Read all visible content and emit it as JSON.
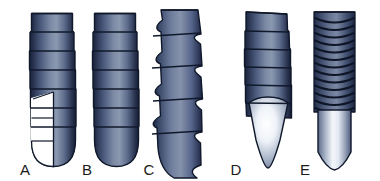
{
  "figure": {
    "background_color": "#ffffff",
    "items": [
      {
        "label": "A",
        "name": "implant-a",
        "description": "Cylindrical implant with V-shaped square threads and rounded apex, shown in partial cut-away section",
        "thread_type": "square",
        "body_shape": "cylindrical",
        "apex": "rounded",
        "thread_count": 7,
        "has_cutaway": true,
        "label_x": 25,
        "label_y": 174
      },
      {
        "label": "B",
        "name": "implant-b",
        "description": "Cylindrical implant with square threads and rounded apex",
        "thread_type": "square",
        "body_shape": "cylindrical",
        "apex": "rounded",
        "thread_count": 7,
        "has_cutaway": false,
        "label_x": 87,
        "label_y": 174
      },
      {
        "label": "C",
        "name": "implant-c",
        "description": "Implant with deep buttress reverse-cut threads forming scalloped profile",
        "thread_type": "buttress",
        "body_shape": "cylindrical",
        "apex": "tapered",
        "thread_count": 5,
        "has_cutaway": false,
        "label_x": 149,
        "label_y": 174
      },
      {
        "label": "D",
        "name": "implant-d",
        "description": "Cylindrical implant with square threads and sharp conical apex",
        "thread_type": "square",
        "body_shape": "cylindrical",
        "apex": "conical-pointed",
        "thread_count": 6,
        "has_cutaway": false,
        "label_x": 236,
        "label_y": 174
      },
      {
        "label": "E",
        "name": "implant-e",
        "description": "Cylindrical implant with fine micro-threads and pointed apex",
        "thread_type": "micro-thread",
        "body_shape": "cylindrical",
        "apex": "pointed",
        "thread_count": 13,
        "has_cutaway": false,
        "label_x": 305,
        "label_y": 174
      }
    ],
    "colors": {
      "metal_dark": "#1b2540",
      "metal_mid": "#4a5a7c",
      "metal_light": "#8f9db5",
      "metal_highlight": "#c3cddd",
      "outline": "#10182b",
      "cutaway_fill": "#ffffff",
      "label_color": "#1a1a1a",
      "background": "#ffffff"
    }
  }
}
